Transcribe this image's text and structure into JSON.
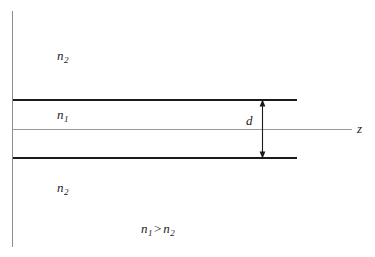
{
  "figure": {
    "width": 375,
    "height": 257,
    "background_color": "#ffffff",
    "line_color_boundary": "#1a1a1a",
    "line_color_axis": "#9a9a9a",
    "text_color": "#1a1a1a"
  },
  "labels": {
    "cladding_upper": {
      "symbol": "n",
      "subscript": "2",
      "text": "n2"
    },
    "core": {
      "symbol": "n",
      "subscript": "1",
      "text": "n1"
    },
    "cladding_lower": {
      "symbol": "n",
      "subscript": "2",
      "text": "n2"
    },
    "thickness": {
      "symbol": "d",
      "text": "d"
    },
    "axis_z": {
      "symbol": "z",
      "text": "z"
    },
    "condition": {
      "left_symbol": "n",
      "left_subscript": "1",
      "operator": ">",
      "right_symbol": "n",
      "right_subscript": "2",
      "text": "n1 > n2"
    }
  },
  "geometry": {
    "vertical_axis": {
      "x": 12,
      "y_top": 11,
      "y_bottom": 247
    },
    "z_axis": {
      "x_start": 12,
      "x_end": 352,
      "y": 129
    },
    "boundary_top": {
      "x_start": 13,
      "x_end": 297,
      "y": 100
    },
    "boundary_bottom": {
      "x_start": 13,
      "x_end": 297,
      "y": 158
    },
    "dimension_arrow": {
      "x": 262,
      "y_top": 100,
      "y_bottom": 158
    }
  }
}
